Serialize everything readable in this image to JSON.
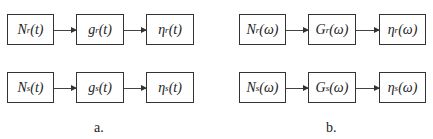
{
  "panel_a": {
    "caption": "a.",
    "rows": [
      {
        "blocks": [
          {
            "main": "N",
            "sub": "r",
            "arg": "(t)"
          },
          {
            "main": "g",
            "sub": "r",
            "arg": "(t)"
          },
          {
            "main": "η",
            "sub": "r",
            "arg": "(t)"
          }
        ]
      },
      {
        "blocks": [
          {
            "main": "N",
            "sub": "s",
            "arg": "(t)"
          },
          {
            "main": "g",
            "sub": "s",
            "arg": "(t)"
          },
          {
            "main": "η",
            "sub": "s",
            "arg": "(t)"
          }
        ]
      }
    ]
  },
  "panel_b": {
    "caption": "b.",
    "rows": [
      {
        "blocks": [
          {
            "main": "N",
            "sub": "r",
            "arg": "(ω)"
          },
          {
            "main": "G",
            "sub": "r",
            "arg": "(ω)"
          },
          {
            "main": "η",
            "sub": "r",
            "arg": "(ω)"
          }
        ]
      },
      {
        "blocks": [
          {
            "main": "N",
            "sub": "s",
            "arg": "(ω)"
          },
          {
            "main": "G",
            "sub": "s",
            "arg": "(ω)"
          },
          {
            "main": "η",
            "sub": "s",
            "arg": "(ω)"
          }
        ]
      }
    ]
  }
}
